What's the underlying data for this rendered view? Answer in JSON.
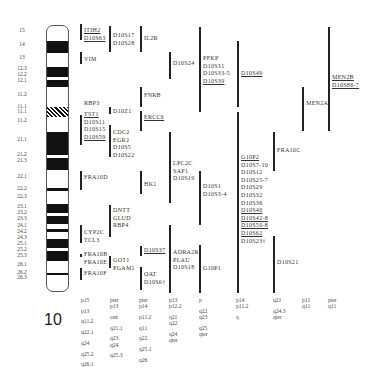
{
  "chromosome": {
    "number": "10",
    "band_labels": [
      {
        "label": "15",
        "y": 30
      },
      {
        "label": "14",
        "y": 44
      },
      {
        "label": "13",
        "y": 57
      },
      {
        "label": "12.3",
        "y": 68
      },
      {
        "label": "12.2",
        "y": 74
      },
      {
        "label": "12.1",
        "y": 80
      },
      {
        "label": "11.2",
        "y": 94
      },
      {
        "label": "11.1",
        "y": 106
      },
      {
        "label": "11.1",
        "y": 111
      },
      {
        "label": "11.2",
        "y": 120
      },
      {
        "label": "21.1",
        "y": 139
      },
      {
        "label": "21.2",
        "y": 154
      },
      {
        "label": "21.3",
        "y": 160
      },
      {
        "label": "22.1",
        "y": 176
      },
      {
        "label": "22.2",
        "y": 188
      },
      {
        "label": "22.3",
        "y": 196
      },
      {
        "label": "23.1",
        "y": 206
      },
      {
        "label": "23.2",
        "y": 212
      },
      {
        "label": "23.3",
        "y": 218
      },
      {
        "label": "24.1",
        "y": 225
      },
      {
        "label": "24.2",
        "y": 231
      },
      {
        "label": "24.3",
        "y": 237
      },
      {
        "label": "25.1",
        "y": 243
      },
      {
        "label": "25.2",
        "y": 249
      },
      {
        "label": "25.3",
        "y": 255
      },
      {
        "label": "26.1",
        "y": 264
      },
      {
        "label": "26.2",
        "y": 272
      },
      {
        "label": "26.3",
        "y": 277
      }
    ]
  },
  "gene_columns": [
    {
      "x": 82,
      "groups": [
        {
          "bar": [
            24,
            40
          ],
          "genes": [
            {
              "t": "ITIH2",
              "u": true
            },
            {
              "t": "D10S63",
              "u": true
            }
          ]
        },
        {
          "bar": [
            52,
            64
          ],
          "genes": [
            {
              "t": "VIM",
              "u": false
            }
          ]
        },
        {
          "bar": null,
          "genes": [
            {
              "t": "RBP3",
              "u": false
            }
          ]
        },
        {
          "bar": [
            115,
            145
          ],
          "genes": [
            {
              "t": "TST1",
              "u": true
            },
            {
              "t": "D10S11",
              "u": false
            },
            {
              "t": "D10S15",
              "u": false
            },
            {
              "t": "D10S59",
              "u": true
            }
          ]
        },
        {
          "bar": [
            171,
            190
          ],
          "genes": [
            {
              "t": "FRA10D",
              "u": false
            }
          ]
        },
        {
          "bar": [
            225,
            243
          ],
          "genes": [
            {
              "t": "CYP2C",
              "u": false
            },
            {
              "t": "TCL3",
              "u": false
            }
          ]
        },
        {
          "bar": [
            254,
            257
          ],
          "genes": [
            {
              "t": "FRA10B",
              "u": false
            },
            {
              "t": "FRA10E",
              "u": false
            }
          ]
        },
        {
          "bar": [
            268,
            280
          ],
          "genes": [
            {
              "t": "FRA10F",
              "u": false
            }
          ]
        }
      ]
    },
    {
      "x": 111,
      "groups": [
        {
          "bar": [
            26,
            52
          ],
          "genes": [
            {
              "t": "D10S17",
              "u": false
            },
            {
              "t": "D10S28",
              "u": false
            }
          ]
        },
        {
          "bar": [
            107,
            114
          ],
          "genes": [
            {
              "t": "D10Z1",
              "u": false
            }
          ]
        },
        {
          "bar": [
            125,
            157
          ],
          "genes": [
            {
              "t": "CDC2",
              "u": false
            },
            {
              "t": "EGR2",
              "u": false
            },
            {
              "t": "D10S5",
              "u": false
            },
            {
              "t": "D10S22",
              "u": false
            }
          ]
        },
        {
          "bar": [
            205,
            237
          ],
          "genes": [
            {
              "t": "DNTT",
              "u": false
            },
            {
              "t": "GLUD",
              "u": false
            },
            {
              "t": "RBP4",
              "u": false
            }
          ]
        },
        {
          "bar": [
            256,
            268
          ],
          "genes": [
            {
              "t": "GOT1",
              "u": false
            },
            {
              "t": "PGAM1",
              "u": false
            }
          ]
        }
      ]
    },
    {
      "x": 142,
      "groups": [
        {
          "bar": [
            26,
            52
          ],
          "genes": [
            {
              "t": "IL2R",
              "u": false
            }
          ]
        },
        {
          "bar": [
            87,
            107
          ],
          "genes": [
            {
              "t": "FNRB",
              "u": false
            }
          ]
        },
        {
          "bar": [
            111,
            131
          ],
          "genes": [
            {
              "t": "ERCC6",
              "u": true
            }
          ]
        },
        {
          "bar": [
            171,
            194
          ],
          "genes": [
            {
              "t": "HK1",
              "u": false
            }
          ]
        },
        {
          "bar": [
            246,
            256
          ],
          "genes": [
            {
              "t": "D10S37",
              "u": true
            }
          ]
        },
        {
          "bar": [
            267,
            290
          ],
          "genes": [
            {
              "t": "OAT",
              "u": false
            },
            {
              "t": "D10S6†",
              "u": false
            }
          ]
        }
      ]
    },
    {
      "x": 171,
      "groups": [
        {
          "bar": [
            52,
            79
          ],
          "genes": [
            {
              "t": "D10S24",
              "u": false
            }
          ]
        },
        {
          "bar": [
            132,
            203
          ],
          "genes": [
            {
              "t": "LPC2C",
              "u": false
            },
            {
              "t": "SAP1",
              "u": false
            },
            {
              "t": "D10S19",
              "u": false
            }
          ]
        },
        {
          "bar": [
            225,
            293
          ],
          "genes": [
            {
              "t": "ADRA2R",
              "u": false
            },
            {
              "t": "PLAU",
              "u": false
            },
            {
              "t": "D10S18",
              "u": false
            }
          ]
        }
      ]
    },
    {
      "x": 201,
      "groups": [
        {
          "bar": [
            27,
            112
          ],
          "genes": [
            {
              "t": "PFKP",
              "u": false
            },
            {
              "t": "D10S31",
              "u": false
            },
            {
              "t": "D10S33-5",
              "u": false
            },
            {
              "t": "D10S39",
              "u": true
            }
          ]
        },
        {
          "bar": [
            171,
            225
          ],
          "genes": [
            {
              "t": "D10S1",
              "u": false
            },
            {
              "t": "D10S3-4",
              "u": false
            }
          ]
        },
        {
          "bar": [
            245,
            293
          ],
          "genes": [
            {
              "t": "G10P1",
              "u": false
            }
          ]
        }
      ]
    },
    {
      "x": 239,
      "groups": [
        {
          "bar": [
            41,
            107
          ],
          "genes": [
            {
              "t": "D10S49",
              "u": true
            }
          ]
        },
        {
          "bar": [
            112,
            293
          ],
          "genes": [
            {
              "t": "G10P2",
              "u": true
            },
            {
              "t": "D10S7-10",
              "u": false
            },
            {
              "t": "D10S12",
              "u": false
            },
            {
              "t": "D10S25-7",
              "u": false
            },
            {
              "t": "D10S29",
              "u": false
            },
            {
              "t": "D10S32",
              "u": false
            },
            {
              "t": "D10S36",
              "u": false
            },
            {
              "t": "D10S40",
              "u": true
            },
            {
              "t": "D10S42-8",
              "u": true
            },
            {
              "t": "D10S50-8",
              "u": true
            },
            {
              "t": "D10S62",
              "u": true
            },
            {
              "t": "D10S23†",
              "u": false
            }
          ]
        }
      ]
    },
    {
      "x": 275,
      "groups": [
        {
          "bar": [
            132,
            171
          ],
          "genes": [
            {
              "t": "FRA10C",
              "u": false
            }
          ]
        },
        {
          "bar": [
            236,
            293
          ],
          "genes": [
            {
              "t": "D10S21",
              "u": false
            }
          ]
        }
      ]
    },
    {
      "x": 304,
      "groups": [
        {
          "bar": [
            87,
            131
          ],
          "genes": [
            {
              "t": "MEN2A",
              "u": false
            }
          ]
        }
      ]
    },
    {
      "x": 330,
      "groups": [
        {
          "bar": [
            27,
            131
          ],
          "genes": [
            {
              "t": "MEN2B",
              "u": true
            },
            {
              "t": "D10S86-7",
              "u": true
            }
          ]
        }
      ]
    }
  ],
  "mapping_columns": [
    {
      "x": 81,
      "rows": [
        [
          "p15"
        ],
        [
          "p13"
        ],
        [
          "q11.2"
        ],
        [
          "q22.1"
        ],
        [
          "q24"
        ],
        [
          "q25.2"
        ],
        [
          "q26.1"
        ]
      ]
    },
    {
      "x": 110,
      "rows": [
        [
          "pter",
          "p13"
        ],
        [
          "cen"
        ],
        [
          "q21.1"
        ],
        [
          "q23",
          "q24"
        ],
        [
          "q25.3"
        ]
      ]
    },
    {
      "x": 139,
      "rows": [
        [
          "pter",
          "p14"
        ],
        [
          "p11.2"
        ],
        [
          "q11"
        ],
        [
          "q22"
        ],
        [
          "q25.1"
        ],
        [
          "q26"
        ]
      ]
    },
    {
      "x": 169,
      "rows": [
        [
          "p13",
          "p12.2"
        ],
        [
          "q21",
          "q22"
        ],
        [
          "q24",
          "qter"
        ]
      ]
    },
    {
      "x": 199,
      "rows": [
        [
          "p"
        ],
        [
          "q22",
          "q23"
        ],
        [
          "q25",
          "qter"
        ]
      ]
    },
    {
      "x": 236,
      "rows": [
        [
          "p14",
          "p11.2"
        ],
        [
          "q"
        ]
      ]
    },
    {
      "x": 273,
      "rows": [
        [
          "q21"
        ],
        [
          "q24.3",
          "qter"
        ]
      ]
    },
    {
      "x": 302,
      "rows": [
        [
          "p11",
          "q11"
        ]
      ]
    },
    {
      "x": 328,
      "rows": [
        [
          "pter",
          "q11"
        ]
      ]
    }
  ]
}
